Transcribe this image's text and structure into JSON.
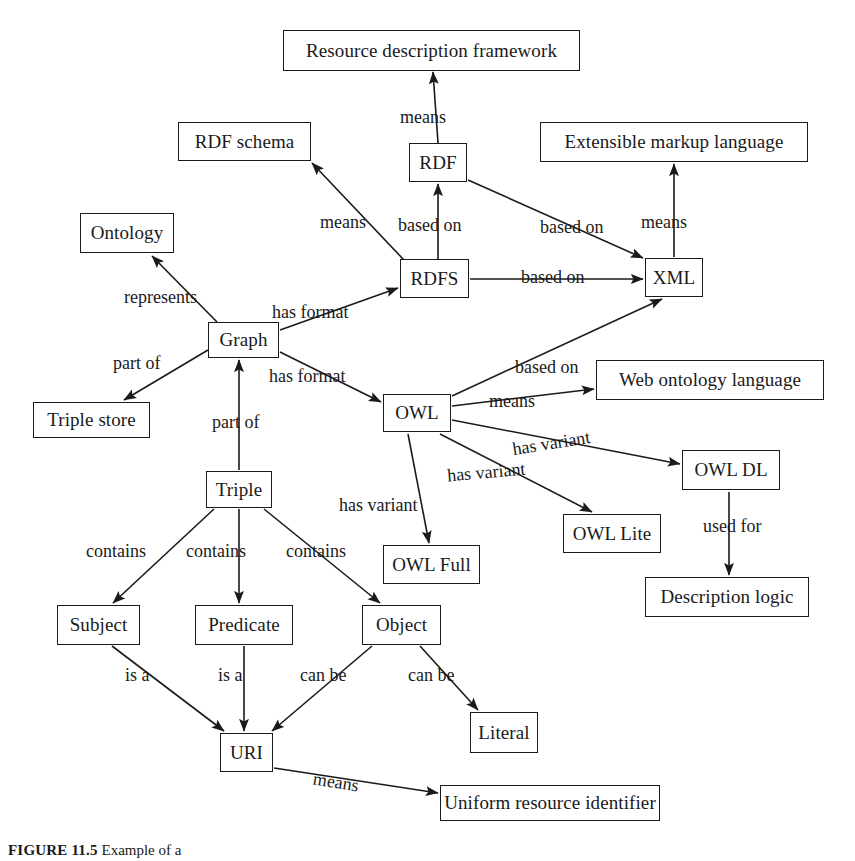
{
  "figure": {
    "caption_label": "FIGURE 11.5",
    "caption_text": "Example of a",
    "width": 855,
    "height": 861,
    "background": "#ffffff",
    "stroke_color": "#1a1a1a"
  },
  "diagram": {
    "type": "concept-map",
    "nodes": [
      {
        "id": "rdf_framework",
        "label": "Resource description framework",
        "x": 283,
        "y": 30,
        "w": 297,
        "h": 41
      },
      {
        "id": "rdf_schema",
        "label": "RDF schema",
        "x": 178,
        "y": 122,
        "w": 133,
        "h": 39
      },
      {
        "id": "ext_markup",
        "label": "Extensible markup language",
        "x": 540,
        "y": 122,
        "w": 268,
        "h": 40
      },
      {
        "id": "rdf",
        "label": "RDF",
        "x": 409,
        "y": 143,
        "w": 58,
        "h": 39
      },
      {
        "id": "ontology",
        "label": "Ontology",
        "x": 80,
        "y": 213,
        "w": 94,
        "h": 40
      },
      {
        "id": "rdfs",
        "label": "RDFS",
        "x": 400,
        "y": 259,
        "w": 69,
        "h": 39
      },
      {
        "id": "xml",
        "label": "XML",
        "x": 645,
        "y": 258,
        "w": 58,
        "h": 39
      },
      {
        "id": "graph",
        "label": "Graph",
        "x": 208,
        "y": 322,
        "w": 71,
        "h": 36
      },
      {
        "id": "triple_store",
        "label": "Triple store",
        "x": 33,
        "y": 402,
        "w": 117,
        "h": 36
      },
      {
        "id": "owl",
        "label": "OWL",
        "x": 383,
        "y": 394,
        "w": 68,
        "h": 38
      },
      {
        "id": "web_ont_lang",
        "label": "Web ontology language",
        "x": 596,
        "y": 360,
        "w": 228,
        "h": 40
      },
      {
        "id": "owl_dl",
        "label": "OWL DL",
        "x": 682,
        "y": 450,
        "w": 98,
        "h": 40
      },
      {
        "id": "triple",
        "label": "Triple",
        "x": 206,
        "y": 471,
        "w": 66,
        "h": 37
      },
      {
        "id": "owl_lite",
        "label": "OWL Lite",
        "x": 563,
        "y": 514,
        "w": 98,
        "h": 39
      },
      {
        "id": "owl_full",
        "label": "OWL Full",
        "x": 383,
        "y": 545,
        "w": 97,
        "h": 39
      },
      {
        "id": "desc_logic",
        "label": "Description logic",
        "x": 645,
        "y": 577,
        "w": 164,
        "h": 40
      },
      {
        "id": "subject",
        "label": "Subject",
        "x": 57,
        "y": 605,
        "w": 83,
        "h": 40
      },
      {
        "id": "predicate",
        "label": "Predicate",
        "x": 195,
        "y": 605,
        "w": 98,
        "h": 40
      },
      {
        "id": "object",
        "label": "Object",
        "x": 362,
        "y": 605,
        "w": 79,
        "h": 40
      },
      {
        "id": "literal",
        "label": "Literal",
        "x": 470,
        "y": 712,
        "w": 68,
        "h": 41
      },
      {
        "id": "uri",
        "label": "URI",
        "x": 220,
        "y": 733,
        "w": 53,
        "h": 39
      },
      {
        "id": "uniform_res",
        "label": "Uniform resource identifier",
        "x": 440,
        "y": 785,
        "w": 220,
        "h": 36
      }
    ],
    "edges": [
      {
        "id": "e1",
        "from": "rdf",
        "to": "rdf_framework",
        "label": "means",
        "x1": 438,
        "y1": 143,
        "x2": 433,
        "y2": 72,
        "lx": 400,
        "ly": 108,
        "rot": 0
      },
      {
        "id": "e2",
        "from": "rdfs",
        "to": "rdf",
        "label": "based on",
        "x1": 438,
        "y1": 259,
        "x2": 438,
        "y2": 184,
        "lx": 398,
        "ly": 216,
        "rot": 0
      },
      {
        "id": "e3",
        "from": "rdfs",
        "to": "rdf_schema",
        "label": "means",
        "x1": 404,
        "y1": 260,
        "x2": 312,
        "y2": 163,
        "lx": 320,
        "ly": 213,
        "rot": 0
      },
      {
        "id": "e4",
        "from": "rdf",
        "to": "xml",
        "label": "based on",
        "x1": 468,
        "y1": 180,
        "x2": 643,
        "y2": 258,
        "lx": 540,
        "ly": 218,
        "rot": 0
      },
      {
        "id": "e5",
        "from": "rdfs",
        "to": "xml",
        "label": "based on",
        "x1": 470,
        "y1": 279,
        "x2": 643,
        "y2": 279,
        "lx": 521,
        "ly": 268,
        "rot": 0
      },
      {
        "id": "e6",
        "from": "xml",
        "to": "ext_markup",
        "label": "means",
        "x1": 674,
        "y1": 257,
        "x2": 674,
        "y2": 164,
        "lx": 641,
        "ly": 213,
        "rot": 0
      },
      {
        "id": "e7",
        "from": "graph",
        "to": "ontology",
        "label": "represents",
        "x1": 217,
        "y1": 322,
        "x2": 152,
        "y2": 256,
        "lx": 124,
        "ly": 288,
        "rot": 0
      },
      {
        "id": "e8",
        "from": "graph",
        "to": "rdfs",
        "label": "has format",
        "x1": 280,
        "y1": 330,
        "x2": 398,
        "y2": 288,
        "lx": 272,
        "ly": 303,
        "rot": 0
      },
      {
        "id": "e9",
        "from": "graph",
        "to": "triple_store",
        "label": "part of",
        "x1": 208,
        "y1": 350,
        "x2": 124,
        "y2": 400,
        "lx": 113,
        "ly": 354,
        "rot": 0
      },
      {
        "id": "e10",
        "from": "graph",
        "to": "owl",
        "label": "has format",
        "x1": 280,
        "y1": 352,
        "x2": 381,
        "y2": 402,
        "lx": 269,
        "ly": 367,
        "rot": 0
      },
      {
        "id": "e11",
        "from": "triple",
        "to": "graph",
        "label": "part of",
        "x1": 239,
        "y1": 470,
        "x2": 239,
        "y2": 360,
        "lx": 212,
        "ly": 413,
        "rot": 0
      },
      {
        "id": "e12",
        "from": "owl",
        "to": "xml",
        "label": "based on",
        "x1": 452,
        "y1": 396,
        "x2": 662,
        "y2": 299,
        "lx": 515,
        "ly": 358,
        "rot": 0
      },
      {
        "id": "e13",
        "from": "owl",
        "to": "web_ont_lang",
        "label": "means",
        "x1": 452,
        "y1": 406,
        "x2": 594,
        "y2": 389,
        "lx": 489,
        "ly": 392,
        "rot": 0
      },
      {
        "id": "e14",
        "from": "owl",
        "to": "owl_dl",
        "label": "has variant",
        "x1": 452,
        "y1": 420,
        "x2": 680,
        "y2": 464,
        "lx": 512,
        "ly": 434,
        "rot": -9
      },
      {
        "id": "e15",
        "from": "owl",
        "to": "owl_lite",
        "label": "has variant",
        "x1": 440,
        "y1": 434,
        "x2": 592,
        "y2": 512,
        "lx": 447,
        "ly": 463,
        "rot": -5
      },
      {
        "id": "e16",
        "from": "owl",
        "to": "owl_full",
        "label": "has variant",
        "x1": 408,
        "y1": 434,
        "x2": 429,
        "y2": 543,
        "lx": 339,
        "ly": 496,
        "rot": 0
      },
      {
        "id": "e17",
        "from": "owl_dl",
        "to": "desc_logic",
        "label": "used for",
        "x1": 729,
        "y1": 492,
        "x2": 729,
        "y2": 575,
        "lx": 703,
        "ly": 517,
        "rot": 0
      },
      {
        "id": "e18",
        "from": "triple",
        "to": "subject",
        "label": "contains",
        "x1": 214,
        "y1": 509,
        "x2": 113,
        "y2": 603,
        "lx": 86,
        "ly": 542,
        "rot": 0
      },
      {
        "id": "e19",
        "from": "triple",
        "to": "predicate",
        "label": "contains",
        "x1": 239,
        "y1": 509,
        "x2": 239,
        "y2": 603,
        "lx": 186,
        "ly": 542,
        "rot": 0
      },
      {
        "id": "e20",
        "from": "triple",
        "to": "object",
        "label": "contains",
        "x1": 264,
        "y1": 509,
        "x2": 380,
        "y2": 603,
        "lx": 286,
        "ly": 542,
        "rot": 0
      },
      {
        "id": "e21",
        "from": "subject",
        "to": "uri",
        "label": "is a",
        "x1": 112,
        "y1": 646,
        "x2": 224,
        "y2": 731,
        "lx": 125,
        "ly": 666,
        "rot": 0
      },
      {
        "id": "e22",
        "from": "predicate",
        "to": "uri",
        "label": "is a",
        "x1": 244,
        "y1": 646,
        "x2": 244,
        "y2": 731,
        "lx": 218,
        "ly": 666,
        "rot": 0
      },
      {
        "id": "e23",
        "from": "object",
        "to": "uri",
        "label": "can be",
        "x1": 372,
        "y1": 646,
        "x2": 272,
        "y2": 731,
        "lx": 300,
        "ly": 666,
        "rot": 0
      },
      {
        "id": "e24",
        "from": "object",
        "to": "literal",
        "label": "can be",
        "x1": 420,
        "y1": 646,
        "x2": 478,
        "y2": 710,
        "lx": 408,
        "ly": 666,
        "rot": 0
      },
      {
        "id": "e25",
        "from": "uri",
        "to": "uniform_res",
        "label": "means",
        "x1": 274,
        "y1": 768,
        "x2": 438,
        "y2": 793,
        "lx": 313,
        "ly": 773,
        "rot": 9
      }
    ]
  }
}
